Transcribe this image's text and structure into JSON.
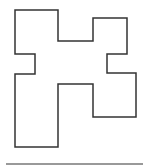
{
  "diagram": {
    "shape": {
      "name": "rectilinear-polygon",
      "stroke": "#333333",
      "fill": "#ffffff",
      "stroke_width": 1.5,
      "points": "15,10 58,10 58,41 93,41 93,18 127,18 127,54 107,54 107,73 136,73 136,117 93,117 93,84 58,84 58,147 15,147 15,74 35,74 35,54 15,54"
    },
    "baseline": {
      "x1": 6,
      "y1": 164,
      "x2": 143,
      "y2": 164,
      "stroke": "#999999",
      "stroke_width": 2
    }
  }
}
